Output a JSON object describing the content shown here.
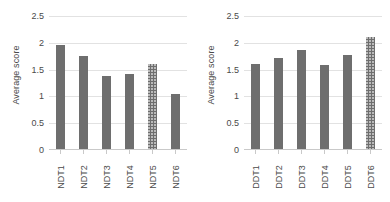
{
  "chart_data": [
    {
      "type": "bar",
      "title": "",
      "xlabel": "",
      "ylabel": "Average score",
      "categories": [
        "NDT1",
        "NDT2",
        "NDT3",
        "NDT4",
        "NDT5",
        "NDT6"
      ],
      "values": [
        1.95,
        1.74,
        1.38,
        1.41,
        1.59,
        1.03
      ],
      "ylim": [
        0,
        2.5
      ],
      "yticks": [
        "0",
        "0.5",
        "1",
        "1.5",
        "2",
        "2.5"
      ],
      "ytick_values": [
        0,
        0.5,
        1,
        1.5,
        2,
        2.5
      ],
      "grid": true,
      "legend": "none",
      "bar_color": "#6e6e6e",
      "gridline_color": "#e2e2e2",
      "textured_bars": [
        4
      ]
    },
    {
      "type": "bar",
      "title": "",
      "xlabel": "",
      "ylabel": "Average score",
      "categories": [
        "DDT1",
        "DDT2",
        "DDT3",
        "DDT4",
        "DDT5",
        "DDT6"
      ],
      "values": [
        1.59,
        1.72,
        1.86,
        1.58,
        1.76,
        2.1
      ],
      "ylim": [
        0,
        2.5
      ],
      "yticks": [
        "0",
        "0.5",
        "1",
        "1.5",
        "2",
        "2.5"
      ],
      "ytick_values": [
        0,
        0.5,
        1,
        1.5,
        2,
        2.5
      ],
      "grid": true,
      "legend": "none",
      "bar_color": "#6e6e6e",
      "gridline_color": "#e2e2e2",
      "textured_bars": [
        5
      ]
    }
  ]
}
